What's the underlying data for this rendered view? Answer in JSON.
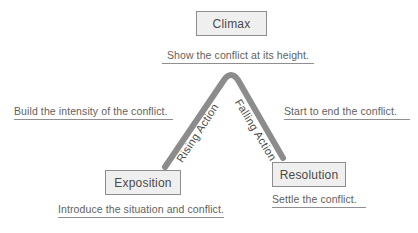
{
  "diagram": {
    "colors": {
      "box_fill": "#efefef",
      "box_border": "#8d8d8d",
      "arc_stroke": "#8c8c8c",
      "text": "#5f5f5f",
      "background": "#ffffff"
    },
    "stages": [
      {
        "id": "climax",
        "label": "Climax",
        "caption": "Show the conflict at its height."
      },
      {
        "id": "exposition",
        "label": "Exposition",
        "caption": "Introduce the situation and conflict."
      },
      {
        "id": "resolution",
        "label": "Resolution",
        "caption": "Settle the conflict."
      }
    ],
    "slopes": [
      {
        "id": "rising",
        "label": "Rising Action",
        "caption": "Build the intensity of the conflict."
      },
      {
        "id": "falling",
        "label": "Falling Action",
        "caption": "Start to end the conflict."
      }
    ]
  }
}
